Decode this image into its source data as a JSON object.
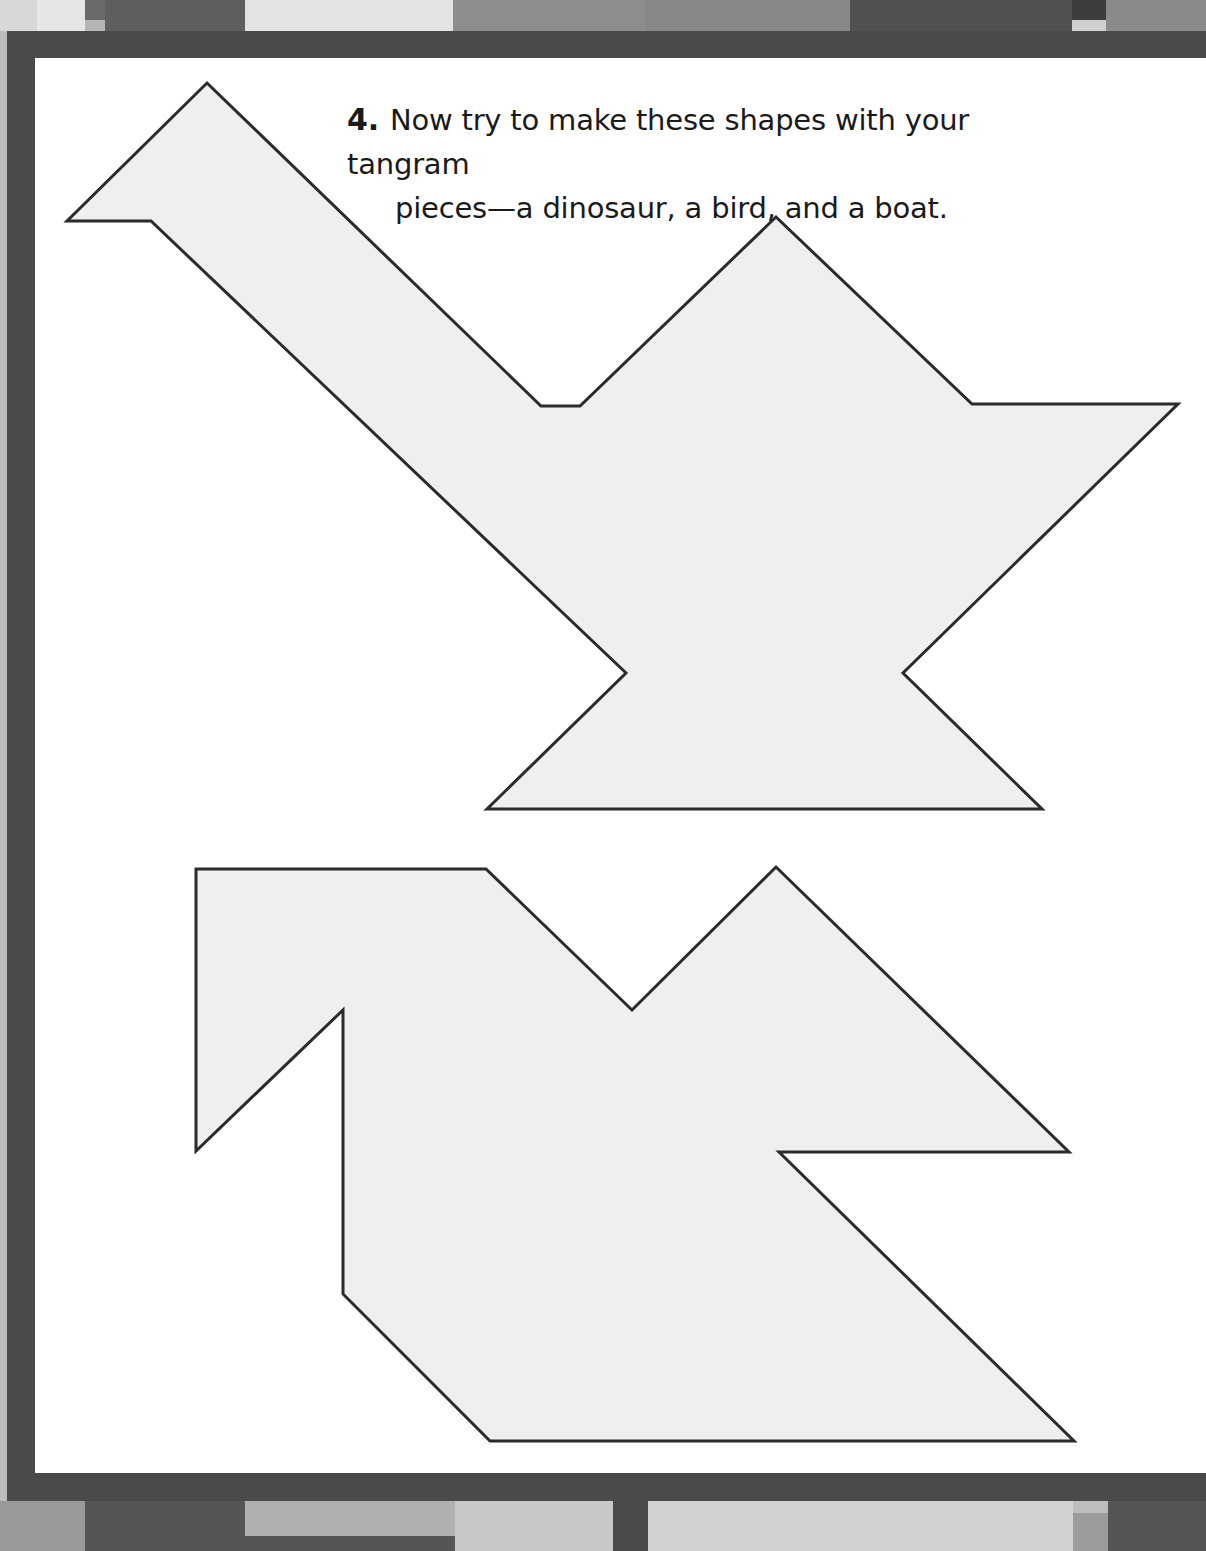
{
  "instruction": {
    "number": "4.",
    "line1": "Now try to make these shapes with your tangram",
    "line2": "pieces—a dinosaur, a bird, and a boat."
  },
  "colors": {
    "frame": "#4a4a4a",
    "page": "#ffffff",
    "shape_fill": "#efefef",
    "shape_stroke": "#2b2b2b"
  },
  "shapes": [
    {
      "name": "dinosaur-silhouette",
      "points": "207,83 541,406 580,406 776,217 972,404 1178,404 903,673 1042,809 487,809 626,673 151,221 67,221"
    },
    {
      "name": "bird-silhouette",
      "points": "196,869 486,869 632,1010 776,867 1069,1152 779,1152 1074,1441 490,1441 343,1294 343,1010 196,1151"
    }
  ]
}
